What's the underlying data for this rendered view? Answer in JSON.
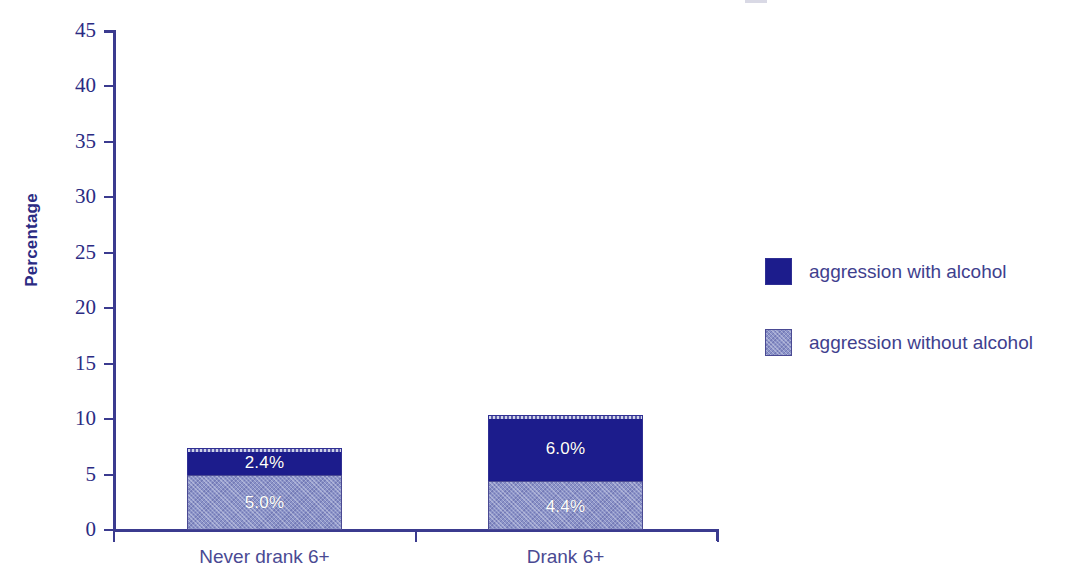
{
  "chart_data": {
    "type": "bar",
    "subtype": "stacked-vertical",
    "title": "",
    "xlabel": "",
    "ylabel": "Percentage",
    "ylim": [
      0,
      45
    ],
    "ytick_step": 5,
    "yticks": [
      0,
      5,
      10,
      15,
      20,
      25,
      30,
      35,
      40,
      45
    ],
    "ytick_labels": [
      "0",
      "5",
      "10",
      "15",
      "20",
      "25",
      "30",
      "35",
      "40",
      "45"
    ],
    "categories": [
      "Never drank 6+",
      "Drank 6+"
    ],
    "grid": false,
    "legend_position": "right",
    "series": [
      {
        "name": "aggression without alcohol",
        "color": "#8b93c8",
        "pattern": "crosshatch",
        "values": [
          5.0,
          4.4
        ],
        "data_labels": [
          "5.0%",
          "4.4%"
        ]
      },
      {
        "name": "aggression with alcohol",
        "color": "#1c1c8c",
        "pattern": "solid",
        "values": [
          2.4,
          6.0
        ],
        "data_labels": [
          "2.4%",
          "6.0%"
        ]
      }
    ],
    "stack_totals": [
      7.4,
      10.4
    ],
    "stack_order_bottom_to_top": [
      "aggression without alcohol",
      "aggression with alcohol"
    ]
  },
  "axes": {
    "y_title": "Percentage",
    "y_tick_labels": [
      "45",
      "40",
      "35",
      "30",
      "25",
      "20",
      "15",
      "10",
      "5",
      "0"
    ],
    "x_tick_labels": [
      "Never drank 6+",
      "Drank 6+"
    ]
  },
  "legend": {
    "items": [
      {
        "label": "aggression with alcohol",
        "swatch": "dark-navy-solid"
      },
      {
        "label": "aggression without alcohol",
        "swatch": "light-blue-hatched"
      }
    ]
  },
  "bars": [
    {
      "category": "Never drank 6+",
      "segments": [
        {
          "series": "aggression with alcohol",
          "value": 2.4,
          "label": "2.4%"
        },
        {
          "series": "aggression without alcohol",
          "value": 5.0,
          "label": "5.0%"
        }
      ]
    },
    {
      "category": "Drank 6+",
      "segments": [
        {
          "series": "aggression with alcohol",
          "value": 6.0,
          "label": "6.0%"
        },
        {
          "series": "aggression without alcohol",
          "value": 4.4,
          "label": "4.4%"
        }
      ]
    }
  ],
  "colors": {
    "with_alcohol": "#1c1c8c",
    "without_alcohol": "#8b93c8",
    "axis": "#3b3b8f",
    "tick_text": "#2b2b83",
    "category_text": "#4a4a93",
    "legend_text": "#3f3f8e",
    "data_label_text": "#ffffff",
    "background": "#ffffff"
  }
}
